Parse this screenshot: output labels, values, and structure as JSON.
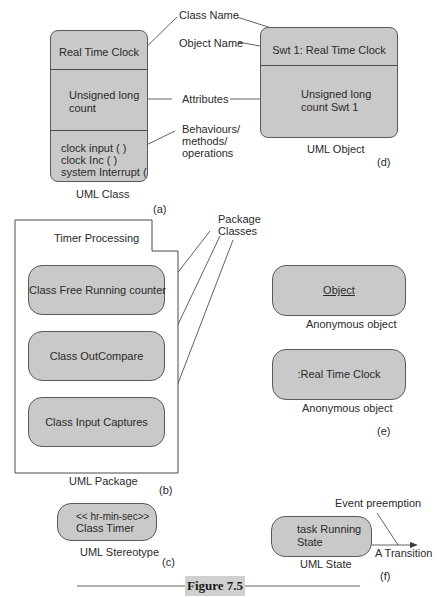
{
  "figure": {
    "caption": "Figure 7.5",
    "panels": {
      "a": {
        "tag": "(a)",
        "caption": "UML Class",
        "class_name": "Real Time Clock",
        "attributes": [
          "Unsigned long",
          "count"
        ],
        "operations": [
          "clock input ( )",
          "clock Inc ( )",
          "system Interrupt ( )"
        ]
      },
      "annotations": {
        "class_name": "Class Name",
        "object_name": "Object  Name",
        "attributes": "Attributes",
        "behaviours": [
          "Behaviours/",
          "methods/",
          "operations"
        ]
      },
      "d": {
        "tag": "(d)",
        "caption": "UML Object",
        "object_name": "Swt 1: Real Time Clock",
        "attributes": [
          "Unsigned long",
          "count Swt 1"
        ]
      },
      "b": {
        "tag": "(b)",
        "caption": "UML Package",
        "package_name": "Timer Processing",
        "package_label": [
          "Package",
          "Classes"
        ],
        "classes": [
          "Class Free Running counter",
          "Class OutCompare",
          "Class Input Captures"
        ]
      },
      "e": {
        "tag": "(e)",
        "objects": [
          {
            "label": "Object",
            "caption": "Anonymous object"
          },
          {
            "label": ":Real Time Clock",
            "caption": "Anonymous object"
          }
        ]
      },
      "c": {
        "tag": "(c)",
        "caption": "UML Stereotype",
        "lines": [
          "<< hr-min-sec>>",
          "Class Timer"
        ]
      },
      "f": {
        "tag": "(f)",
        "caption": "UML State",
        "state": [
          "task Running",
          "State"
        ],
        "event": "Event preemption",
        "transition": "A Transition"
      }
    }
  }
}
